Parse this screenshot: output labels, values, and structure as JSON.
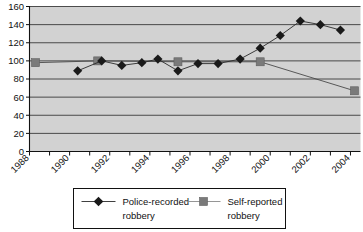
{
  "chart_data": {
    "type": "line",
    "title": "",
    "xlabel": "",
    "ylabel": "",
    "xlim": [
      1988,
      2004.5
    ],
    "ylim": [
      0,
      160
    ],
    "ytick_step": 20,
    "yticks": [
      "0",
      "20",
      "40",
      "60",
      "80",
      "100",
      "120",
      "140",
      "160"
    ],
    "xticks": [
      "1988",
      "1990",
      "1992",
      "1994",
      "1996",
      "1998",
      "2000",
      "2002",
      "2004"
    ],
    "grid": "horizontal",
    "legend_position": "bottom",
    "plot_background": "#d2d2d2",
    "series": [
      {
        "name": "Police-recorded robbery",
        "marker": "diamond",
        "color": "#1a1a1a",
        "x": [
          1990.4,
          1991.6,
          1992.6,
          1993.6,
          1994.4,
          1995.4,
          1996.4,
          1997.4,
          1998.5,
          1999.5,
          2000.5,
          2001.5,
          2002.5,
          2003.5
        ],
        "values": [
          89,
          100,
          95,
          98,
          102,
          89,
          97,
          97,
          102,
          114,
          128,
          144,
          140,
          134
        ]
      },
      {
        "name": "Self-reported robbery",
        "marker": "square",
        "color": "#7a7a7a",
        "x": [
          1988.3,
          1991.4,
          1995.4,
          1999.5,
          2004.2
        ],
        "values": [
          98,
          100,
          99,
          99,
          67
        ]
      }
    ]
  },
  "legend": {
    "entries": [
      {
        "label_line1": "Police-recorded",
        "label_line2": "robbery",
        "marker": "diamond-marker-icon"
      },
      {
        "label_line1": "Self-reported",
        "label_line2": "robbery",
        "marker": "square-marker-icon"
      }
    ]
  }
}
